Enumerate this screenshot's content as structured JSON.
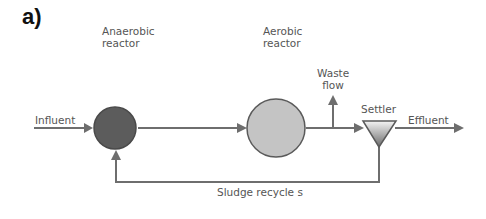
{
  "panel_label": "a)",
  "labels": {
    "anaerobic_line1": "Anaerobic",
    "anaerobic_line2": "reactor",
    "aerobic_line1": "Aerobic",
    "aerobic_line2": "reactor",
    "waste_line1": "Waste",
    "waste_line2": "flow",
    "settler": "Settler",
    "influent": "Influent",
    "effluent": "Effluent",
    "sludge_recycle": "Sludge recycle s"
  },
  "colors": {
    "line": "#6e6e6e",
    "anaerobic_fill": "#5c5c5c",
    "aerobic_fill": "#c4c4c4",
    "text": "#555555"
  }
}
